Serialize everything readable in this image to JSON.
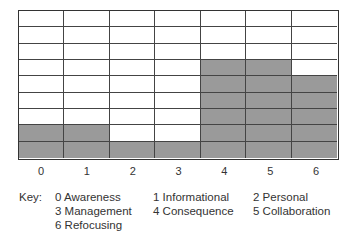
{
  "chart_data": {
    "type": "bar",
    "title": "",
    "xlabel": "",
    "ylabel": "",
    "categories": [
      "0",
      "1",
      "2",
      "3",
      "4",
      "5",
      "6"
    ],
    "values": [
      2,
      2,
      1,
      1,
      6,
      6,
      5
    ],
    "ylim": [
      0,
      9
    ],
    "grid": true,
    "rows": 9,
    "fill_color": "#9a9a9a",
    "legend_position": "bottom",
    "key": {
      "label": "Key:",
      "items": [
        {
          "code": "0",
          "name": "Awareness"
        },
        {
          "code": "1",
          "name": "Informational"
        },
        {
          "code": "2",
          "name": "Personal"
        },
        {
          "code": "3",
          "name": "Management"
        },
        {
          "code": "4",
          "name": "Consequence"
        },
        {
          "code": "5",
          "name": "Collaboration"
        },
        {
          "code": "6",
          "name": "Refocusing"
        }
      ]
    }
  }
}
